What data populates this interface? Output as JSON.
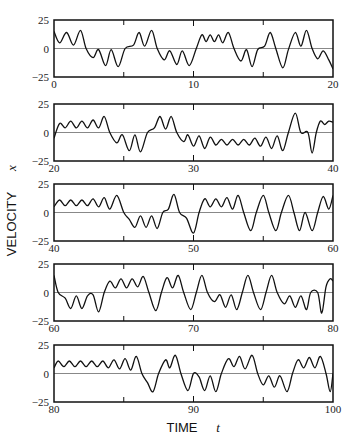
{
  "chart_data": {
    "type": "line",
    "title": "",
    "xlabel": "TIME",
    "xlabel_var": "t",
    "ylabel": "VELOCITY",
    "ylabel_var": "x",
    "ylim": [
      -25,
      25
    ],
    "yticks": [
      25,
      0,
      -25
    ],
    "ytick_labels": [
      "25",
      "0",
      "−25"
    ],
    "grid": false,
    "zero_line": true,
    "panels": [
      {
        "xlim": [
          0,
          20
        ],
        "xtick_labels": [
          "0",
          "10",
          "20"
        ],
        "minor_ticks": [
          5,
          15
        ],
        "events": [
          [
            0,
            15
          ],
          [
            0.4,
            5
          ],
          [
            0.9,
            14
          ],
          [
            1.4,
            3
          ],
          [
            1.9,
            16
          ],
          [
            2.3,
            0
          ],
          [
            2.8,
            -8
          ],
          [
            3.2,
            -1
          ],
          [
            3.7,
            -15
          ],
          [
            4.1,
            -1
          ],
          [
            4.6,
            -16
          ],
          [
            5.1,
            0
          ],
          [
            5.7,
            3
          ],
          [
            6.1,
            14
          ],
          [
            6.5,
            2
          ],
          [
            7,
            16
          ],
          [
            7.4,
            0
          ],
          [
            7.9,
            -10
          ],
          [
            8.3,
            -2
          ],
          [
            8.8,
            -14
          ],
          [
            9.2,
            -2
          ],
          [
            9.7,
            -15
          ],
          [
            10.2,
            0
          ],
          [
            10.6,
            12
          ],
          [
            10.9,
            6
          ],
          [
            11.2,
            12
          ],
          [
            11.5,
            6
          ],
          [
            11.8,
            12
          ],
          [
            12.1,
            5
          ],
          [
            12.5,
            14
          ],
          [
            12.9,
            0
          ],
          [
            13.4,
            -11
          ],
          [
            13.8,
            -1
          ],
          [
            14.2,
            -16
          ],
          [
            14.6,
            -1
          ],
          [
            15.1,
            2
          ],
          [
            15.5,
            14
          ],
          [
            15.9,
            0
          ],
          [
            16.4,
            -17
          ],
          [
            16.8,
            -1
          ],
          [
            17.3,
            14
          ],
          [
            17.7,
            2
          ],
          [
            18.1,
            16
          ],
          [
            18.5,
            0
          ],
          [
            18.9,
            -9
          ],
          [
            19.3,
            -2
          ],
          [
            19.7,
            -10
          ],
          [
            20,
            -18
          ]
        ]
      },
      {
        "xlim": [
          20,
          40
        ],
        "xtick_labels": [
          "20",
          "30",
          "40"
        ],
        "minor_ticks": [
          25,
          35
        ],
        "events": [
          [
            20,
            -5
          ],
          [
            20.4,
            8
          ],
          [
            20.8,
            4
          ],
          [
            21.2,
            10
          ],
          [
            21.6,
            4
          ],
          [
            22,
            10
          ],
          [
            22.4,
            4
          ],
          [
            22.8,
            11
          ],
          [
            23.2,
            4
          ],
          [
            23.6,
            14
          ],
          [
            24,
            0
          ],
          [
            24.5,
            -9
          ],
          [
            24.9,
            -2
          ],
          [
            25.4,
            -16
          ],
          [
            25.8,
            -2
          ],
          [
            26.2,
            -17
          ],
          [
            26.7,
            0
          ],
          [
            27.2,
            4
          ],
          [
            27.6,
            14
          ],
          [
            28,
            3
          ],
          [
            28.4,
            14
          ],
          [
            28.8,
            0
          ],
          [
            29.3,
            -8
          ],
          [
            29.6,
            -2
          ],
          [
            30,
            -12
          ],
          [
            30.4,
            -3
          ],
          [
            30.8,
            -14
          ],
          [
            31.2,
            -4
          ],
          [
            31.6,
            -11
          ],
          [
            32,
            -6
          ],
          [
            32.4,
            -11
          ],
          [
            32.8,
            -6
          ],
          [
            33.2,
            -11
          ],
          [
            33.6,
            -6
          ],
          [
            34,
            -11
          ],
          [
            34.4,
            -5
          ],
          [
            34.8,
            -12
          ],
          [
            35.2,
            -4
          ],
          [
            35.6,
            -14
          ],
          [
            36,
            -3
          ],
          [
            36.4,
            -16
          ],
          [
            36.8,
            0
          ],
          [
            37.3,
            17
          ],
          [
            37.7,
            0
          ],
          [
            38.2,
            0
          ],
          [
            38.5,
            -18
          ],
          [
            38.8,
            0
          ],
          [
            39.1,
            10
          ],
          [
            39.4,
            7
          ],
          [
            39.7,
            10
          ],
          [
            40,
            9
          ]
        ]
      },
      {
        "xlim": [
          40,
          60
        ],
        "xtick_labels": [
          "40",
          "50",
          "60"
        ],
        "minor_ticks": [
          45,
          55
        ],
        "events": [
          [
            40,
            5
          ],
          [
            40.4,
            11
          ],
          [
            40.8,
            6
          ],
          [
            41.2,
            11
          ],
          [
            41.6,
            6
          ],
          [
            42,
            11
          ],
          [
            42.4,
            6
          ],
          [
            42.8,
            12
          ],
          [
            43.2,
            5
          ],
          [
            43.6,
            13
          ],
          [
            44,
            3
          ],
          [
            44.5,
            15
          ],
          [
            45,
            0
          ],
          [
            45.4,
            -6
          ],
          [
            45.8,
            -13
          ],
          [
            46.2,
            -3
          ],
          [
            46.6,
            -13
          ],
          [
            47,
            -3
          ],
          [
            47.4,
            -14
          ],
          [
            47.8,
            0
          ],
          [
            48.2,
            3
          ],
          [
            48.6,
            16
          ],
          [
            49,
            0
          ],
          [
            49.5,
            -5
          ],
          [
            50,
            -18
          ],
          [
            50.4,
            0
          ],
          [
            50.8,
            12
          ],
          [
            51.2,
            5
          ],
          [
            51.6,
            12
          ],
          [
            52,
            5
          ],
          [
            52.4,
            13
          ],
          [
            52.8,
            3
          ],
          [
            53.2,
            15
          ],
          [
            53.6,
            0
          ],
          [
            54.1,
            -16
          ],
          [
            54.5,
            0
          ],
          [
            55,
            15
          ],
          [
            55.4,
            0
          ],
          [
            55.9,
            -16
          ],
          [
            56.3,
            0
          ],
          [
            56.8,
            15
          ],
          [
            57.2,
            0
          ],
          [
            57.6,
            -16
          ],
          [
            58,
            0
          ],
          [
            58.5,
            -16
          ],
          [
            58.9,
            0
          ],
          [
            59.3,
            14
          ],
          [
            59.7,
            3
          ],
          [
            60,
            15
          ]
        ]
      },
      {
        "xlim": [
          60,
          80
        ],
        "xtick_labels": [
          "60",
          "70",
          "80"
        ],
        "minor_ticks": [
          65,
          75
        ],
        "events": [
          [
            60,
            15
          ],
          [
            60.3,
            0
          ],
          [
            60.8,
            -5
          ],
          [
            61.2,
            -14
          ],
          [
            61.6,
            -3
          ],
          [
            62,
            -14
          ],
          [
            62.4,
            -3
          ],
          [
            62.8,
            -2
          ],
          [
            63.2,
            -17
          ],
          [
            63.6,
            0
          ],
          [
            64,
            10
          ],
          [
            64.4,
            4
          ],
          [
            64.8,
            12
          ],
          [
            65.2,
            4
          ],
          [
            65.6,
            12
          ],
          [
            66,
            5
          ],
          [
            66.4,
            14
          ],
          [
            66.8,
            0
          ],
          [
            67.3,
            -16
          ],
          [
            67.7,
            0
          ],
          [
            68.1,
            13
          ],
          [
            68.5,
            4
          ],
          [
            68.9,
            15
          ],
          [
            69.3,
            0
          ],
          [
            69.8,
            -15
          ],
          [
            70.2,
            0
          ],
          [
            70.6,
            15
          ],
          [
            71,
            0
          ],
          [
            71.5,
            -8
          ],
          [
            71.9,
            -2
          ],
          [
            72.3,
            -13
          ],
          [
            72.7,
            -2
          ],
          [
            73.1,
            -15
          ],
          [
            73.5,
            0
          ],
          [
            73.9,
            15
          ],
          [
            74.3,
            0
          ],
          [
            74.8,
            -15
          ],
          [
            75.2,
            0
          ],
          [
            75.6,
            15
          ],
          [
            76,
            0
          ],
          [
            76.5,
            -10
          ],
          [
            76.9,
            -3
          ],
          [
            77.3,
            -13
          ],
          [
            77.7,
            -3
          ],
          [
            78.1,
            -15
          ],
          [
            78.4,
            0
          ],
          [
            78.9,
            0
          ],
          [
            79.2,
            -18
          ],
          [
            79.5,
            5
          ],
          [
            79.8,
            12
          ],
          [
            80,
            10
          ]
        ]
      },
      {
        "xlim": [
          80,
          100
        ],
        "xtick_labels": [
          "80",
          "90",
          "100"
        ],
        "minor_ticks": [
          85,
          95
        ],
        "events": [
          [
            80,
            5
          ],
          [
            80.3,
            11
          ],
          [
            80.7,
            6
          ],
          [
            81.1,
            11
          ],
          [
            81.5,
            6
          ],
          [
            81.9,
            11
          ],
          [
            82.3,
            6
          ],
          [
            82.7,
            11
          ],
          [
            83.1,
            6
          ],
          [
            83.5,
            11
          ],
          [
            83.9,
            5
          ],
          [
            84.3,
            12
          ],
          [
            84.7,
            4
          ],
          [
            85.1,
            13
          ],
          [
            85.5,
            3
          ],
          [
            85.9,
            15
          ],
          [
            86.3,
            0
          ],
          [
            86.7,
            -8
          ],
          [
            87.1,
            -16
          ],
          [
            87.5,
            0
          ],
          [
            88,
            12
          ],
          [
            88.3,
            5
          ],
          [
            88.7,
            16
          ],
          [
            89.1,
            0
          ],
          [
            89.6,
            -15
          ],
          [
            90,
            0
          ],
          [
            90.4,
            -3
          ],
          [
            90.8,
            -15
          ],
          [
            91.2,
            -2
          ],
          [
            91.6,
            -16
          ],
          [
            92,
            0
          ],
          [
            92.5,
            13
          ],
          [
            92.9,
            6
          ],
          [
            93.3,
            15
          ],
          [
            93.7,
            4
          ],
          [
            94.2,
            16
          ],
          [
            94.6,
            0
          ],
          [
            95,
            -10
          ],
          [
            95.4,
            -2
          ],
          [
            95.8,
            -12
          ],
          [
            96.2,
            -2
          ],
          [
            96.7,
            -16
          ],
          [
            97.1,
            0
          ],
          [
            97.5,
            12
          ],
          [
            97.9,
            5
          ],
          [
            98.3,
            14
          ],
          [
            98.7,
            5
          ],
          [
            99.1,
            15
          ],
          [
            99.5,
            0
          ],
          [
            99.8,
            -16
          ],
          [
            100,
            0
          ]
        ]
      }
    ]
  }
}
